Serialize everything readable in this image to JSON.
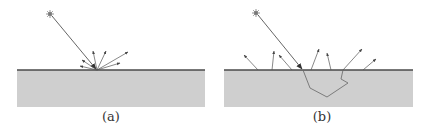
{
  "panels": [
    {
      "id": "a",
      "label": "(a)",
      "description": "surface reflection: incoming ray scatters at surface point",
      "surface": {
        "x1": 17,
        "x2": 205,
        "y": 70,
        "bottom": 107
      },
      "source": {
        "x": 50,
        "y": 14
      },
      "impact": {
        "x": 97,
        "y": 70
      },
      "reflected_rays": [
        {
          "to": [
            82,
            60
          ]
        },
        {
          "to": [
            80,
            66
          ]
        },
        {
          "to": [
            93,
            51
          ]
        },
        {
          "to": [
            106,
            51
          ]
        },
        {
          "to": [
            128,
            52
          ]
        },
        {
          "to": [
            120,
            63
          ]
        }
      ]
    },
    {
      "id": "b",
      "label": "(b)",
      "description": "subsurface scattering: ray enters material, travels inside, exits at various points",
      "surface": {
        "x1": 224,
        "x2": 413,
        "y": 70,
        "bottom": 107
      },
      "source": {
        "x": 256,
        "y": 13
      },
      "entry": {
        "x": 303,
        "y": 70
      },
      "subsurface_path": [
        [
          303,
          70
        ],
        [
          310,
          88
        ],
        [
          327,
          97
        ],
        [
          348,
          83
        ],
        [
          341,
          79
        ],
        [
          343,
          70
        ]
      ],
      "exit_rays": [
        {
          "from": [
            258,
            70
          ],
          "to": [
            244,
            55
          ]
        },
        {
          "from": [
            272,
            70
          ],
          "to": [
            274,
            51
          ]
        },
        {
          "from": [
            292,
            70
          ],
          "to": [
            279,
            55
          ]
        },
        {
          "from": [
            311,
            70
          ],
          "to": [
            319,
            49
          ]
        },
        {
          "from": [
            331,
            70
          ],
          "to": [
            327,
            53
          ]
        },
        {
          "from": [
            343,
            70
          ],
          "to": [
            362,
            49
          ]
        },
        {
          "from": [
            363,
            70
          ],
          "to": [
            376,
            59
          ]
        }
      ]
    }
  ],
  "colors": {
    "material": "#cfcfcf",
    "surface_line": "#4a4a4a",
    "ray": "#555555",
    "background": "#ffffff"
  }
}
